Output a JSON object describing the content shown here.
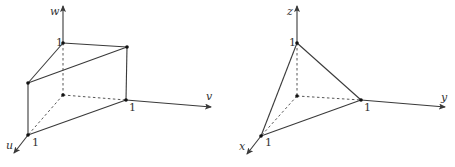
{
  "figures": [
    {
      "id": "prism",
      "axes": {
        "vertical": "w",
        "right": "v",
        "front": "u"
      },
      "tick_labels": {
        "vertical": "1",
        "right": "1",
        "front": "1"
      },
      "shape": "triangular prism with vertices (0,0,0),(1,0,0),(0,1,0),(0,0,1),(1,0,1),(0,1,1)"
    },
    {
      "id": "tetrahedron",
      "axes": {
        "vertical": "z",
        "right": "y",
        "front": "x"
      },
      "tick_labels": {
        "vertical": "1",
        "right": "1",
        "front": "1"
      },
      "shape": "tetrahedron with vertices (0,0,0),(1,0,0),(0,1,0),(0,0,1)"
    }
  ],
  "colors": {
    "line": "#3a3a3a",
    "background": "#ffffff"
  }
}
